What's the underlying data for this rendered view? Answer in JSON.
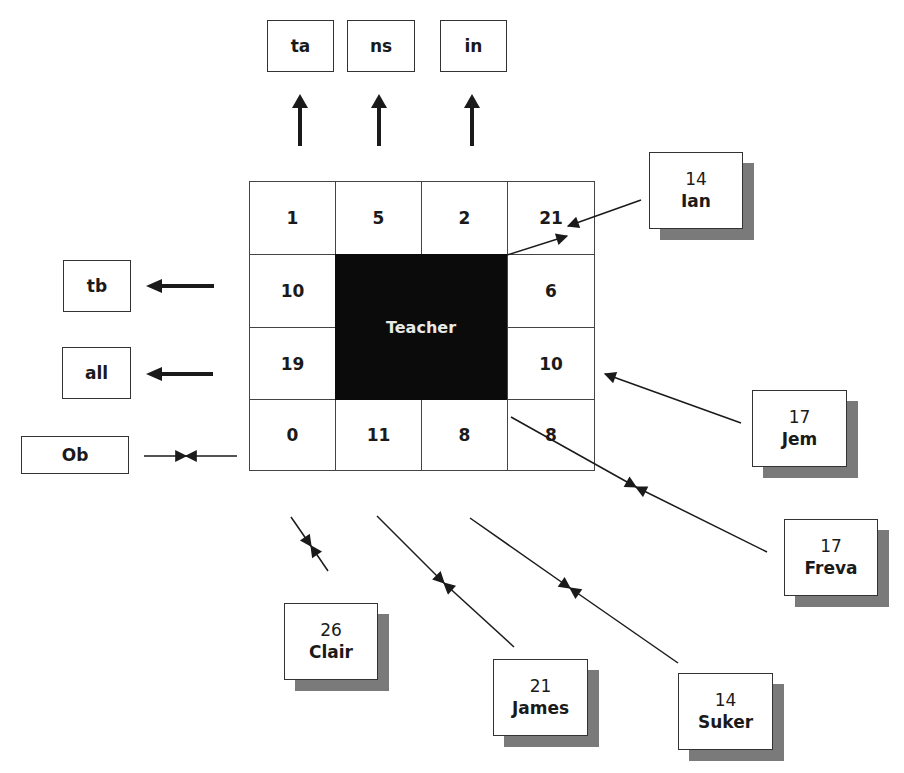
{
  "diagram": {
    "type": "classroom-interaction-seating-chart",
    "teacher_label": "Teacher",
    "grid": {
      "rows": [
        [
          "1",
          "5",
          "2",
          "21"
        ],
        [
          "10",
          "",
          "",
          "6"
        ],
        [
          "19",
          "",
          "",
          "10"
        ],
        [
          "0",
          "11",
          "8",
          "8"
        ]
      ]
    },
    "top_categories": [
      {
        "label": "ta"
      },
      {
        "label": "ns"
      },
      {
        "label": "in"
      }
    ],
    "left_categories": [
      {
        "label": "tb"
      },
      {
        "label": "all"
      },
      {
        "label": "Ob"
      }
    ],
    "students": [
      {
        "name": "Ian",
        "count": "14"
      },
      {
        "name": "Jem",
        "count": "17"
      },
      {
        "name": "Freva",
        "count": "17"
      },
      {
        "name": "Clair",
        "count": "26"
      },
      {
        "name": "James",
        "count": "21"
      },
      {
        "name": "Suker",
        "count": "14"
      }
    ],
    "colors": {
      "teacher_fill": "#0b0b0b",
      "shadow": "#7a7a7a",
      "line": "#1a1a1a"
    }
  }
}
